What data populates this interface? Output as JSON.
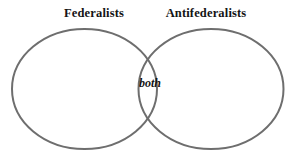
{
  "diagram": {
    "type": "venn-diagram",
    "sets": [
      {
        "id": "left",
        "label": "Federalists"
      },
      {
        "id": "right",
        "label": "Antifederalists"
      }
    ],
    "intersection": {
      "label": "both"
    },
    "style": {
      "background_color": "#ffffff",
      "stroke_color": "#6e6e6e",
      "stroke_width": 2,
      "fill": "none",
      "text_color": "#141414"
    },
    "geometry": {
      "left_ellipse": {
        "cx": 84.5,
        "cy": 89,
        "rx": 72.5,
        "ry": 60
      },
      "right_ellipse": {
        "cx": 211,
        "cy": 89,
        "rx": 72.5,
        "ry": 60
      }
    }
  }
}
